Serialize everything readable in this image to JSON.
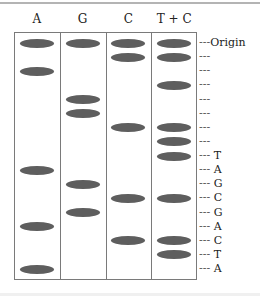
{
  "diagram": {
    "lanes": [
      {
        "label": "A",
        "band_rows": [
          0,
          2,
          9,
          13,
          16
        ]
      },
      {
        "label": "G",
        "band_rows": [
          0,
          4,
          5,
          10,
          12
        ]
      },
      {
        "label": "C",
        "band_rows": [
          0,
          1,
          6,
          11,
          14
        ]
      },
      {
        "label": "T + C",
        "band_rows": [
          0,
          1,
          3,
          6,
          7,
          8,
          11,
          14,
          15
        ]
      }
    ],
    "row_markers": [
      {
        "row": 0,
        "dash": "---",
        "label": "Origin"
      },
      {
        "row": 1,
        "dash": "---",
        "label": ""
      },
      {
        "row": 2,
        "dash": "---",
        "label": ""
      },
      {
        "row": 3,
        "dash": "---",
        "label": ""
      },
      {
        "row": 4,
        "dash": "---",
        "label": ""
      },
      {
        "row": 5,
        "dash": "---",
        "label": ""
      },
      {
        "row": 6,
        "dash": "---",
        "label": ""
      },
      {
        "row": 7,
        "dash": "---",
        "label": ""
      },
      {
        "row": 8,
        "dash": "---",
        "label": "T"
      },
      {
        "row": 9,
        "dash": "---",
        "label": "A"
      },
      {
        "row": 10,
        "dash": "---",
        "label": "G"
      },
      {
        "row": 11,
        "dash": "---",
        "label": "C"
      },
      {
        "row": 12,
        "dash": "---",
        "label": "G"
      },
      {
        "row": 13,
        "dash": "---",
        "label": "A"
      },
      {
        "row": 14,
        "dash": "---",
        "label": "C"
      },
      {
        "row": 15,
        "dash": "---",
        "label": "T"
      },
      {
        "row": 16,
        "dash": "---",
        "label": "A"
      }
    ],
    "colors": {
      "band": "#5e5e5e",
      "frame": "#7a7a7a"
    }
  }
}
